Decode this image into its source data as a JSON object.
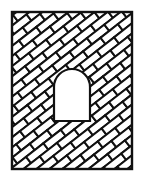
{
  "figure": {
    "colors": {
      "stroke": "#111111",
      "fill": "#ffffff",
      "background": "#ffffff"
    },
    "frame": {
      "x": 12,
      "y": 12,
      "width": 120,
      "height": 157
    },
    "opening": {
      "x": 54,
      "y": 69,
      "width": 36,
      "height": 52,
      "arch_radius": 18
    },
    "brick": {
      "length": 22,
      "height": 8,
      "angle_deg": -38
    }
  }
}
